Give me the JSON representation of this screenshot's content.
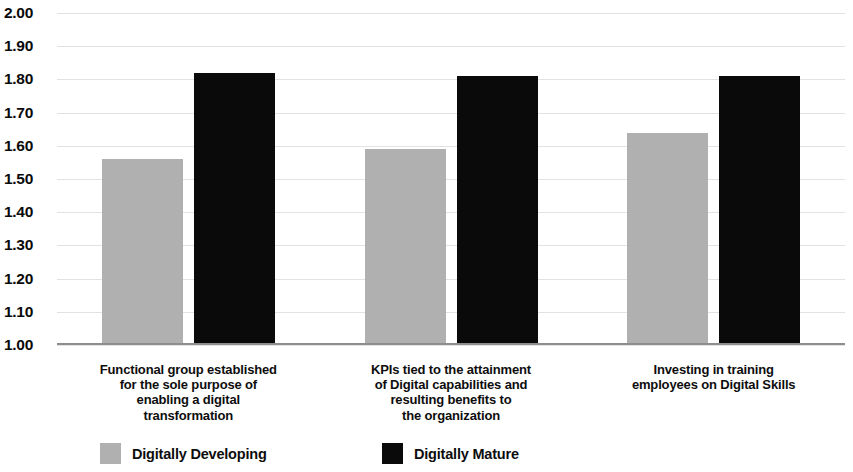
{
  "chart_data": {
    "type": "bar",
    "title": "",
    "subtitle": "",
    "xlabel": "",
    "ylabel": "",
    "ylim": [
      1.0,
      2.0
    ],
    "ytick_step": 0.1,
    "ytick_labels": [
      "2.00",
      "1.90",
      "1.80",
      "1.70",
      "1.60",
      "1.50",
      "1.40",
      "1.30",
      "1.20",
      "1.10",
      "1.00"
    ],
    "grid": true,
    "legend_position": "bottom",
    "categories": [
      "Functional group established for the sole purpose of enabling a digital transformation",
      "KPIs tied to the attainment of Digital capabilities and resulting benefits to the organization",
      "Investing in training employees on Digital Skills"
    ],
    "category_label_lines": [
      [
        "Functional group established",
        "for the sole purpose of",
        "enabling a digital",
        "transformation"
      ],
      [
        "KPIs tied to the attainment",
        "of Digital capabilities and",
        "resulting benefits to",
        "the organization"
      ],
      [
        "Investing in training",
        "employees on Digital Skills"
      ]
    ],
    "series": [
      {
        "name": "Digitally Developing",
        "color": "#b0b0b0",
        "values": [
          1.56,
          1.59,
          1.64
        ]
      },
      {
        "name": "Digitally Mature",
        "color": "#0a0a0a",
        "values": [
          1.82,
          1.81,
          1.81
        ]
      }
    ]
  },
  "legend": {
    "entries": [
      {
        "label": "Digitally Developing",
        "swatch": "developing"
      },
      {
        "label": "Digitally Mature",
        "swatch": "mature"
      }
    ]
  }
}
